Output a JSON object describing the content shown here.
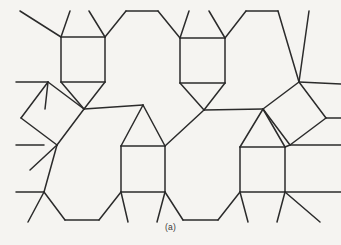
{
  "figure": {
    "caption": "(a)",
    "background_color": "#f5f4f1",
    "stroke_color": "#2b2b2b",
    "stroke_width": 1.5,
    "width": 341,
    "height": 245
  },
  "chart_data": {
    "type": "diagram",
    "subtype": "geometric-tiling",
    "caption": "(a)",
    "xlabel": "",
    "ylabel": "",
    "xlim": [
      0,
      341
    ],
    "ylim": [
      0,
      245
    ],
    "grid": false,
    "legend": null,
    "tile_counts": {
      "squares_axis_aligned": 4,
      "squares_tilted": 2,
      "triangles": 4,
      "hexagons_full_or_partial": 6
    },
    "polygons": [
      {
        "name": "square-top-left",
        "shape": "square",
        "points": "61,37 105,37 105,82 61,82"
      },
      {
        "name": "square-top-right",
        "shape": "square",
        "points": "180,38 225,38 225,83 180,83"
      },
      {
        "name": "square-bottom-left",
        "shape": "square",
        "points": "121,146 165,146 165,192 121,192"
      },
      {
        "name": "square-bottom-right",
        "shape": "square",
        "points": "240,147 285,147 285,192 240,192"
      },
      {
        "name": "square-tilted-left",
        "shape": "square",
        "points": "48,82 21,118 57,145 84,109"
      },
      {
        "name": "square-tilted-right",
        "shape": "square",
        "points": "263,109 290,145 326,118 299,82"
      },
      {
        "name": "triangle-up-left",
        "shape": "triangle",
        "points": "143,105 121,146 165,146"
      },
      {
        "name": "triangle-up-right",
        "shape": "triangle",
        "points": "263,109 240,147 285,147"
      },
      {
        "name": "triangle-down-left",
        "shape": "triangle",
        "points": "61,82 105,82 84,109"
      },
      {
        "name": "triangle-down-right",
        "shape": "triangle",
        "points": "180,83 225,83 204,110"
      },
      {
        "name": "hexagon-top-middle",
        "shape": "hexagon",
        "points": "105,37 126,11 158,11 180,38 162,66 126,66"
      },
      {
        "name": "hexagon-center-left",
        "shape": "hexagon",
        "points": "84,109 143,105 121,146 57,145 41,120 48,82"
      },
      {
        "name": "hexagon-center-right",
        "shape": "hexagon",
        "points": "204,110 263,109 240,147 180,146 162,120 180,83"
      },
      {
        "name": "hexagon-bottom-left",
        "shape": "hexagon",
        "points": "57,145 121,146 121,192 99,220 65,220 44,192"
      },
      {
        "name": "hexagon-bottom-right",
        "shape": "hexagon",
        "points": "180,192 240,192 240,192 218,220 183,220 165,192"
      }
    ],
    "edges": [
      {
        "name": "sq-tl-top",
        "x1": 61,
        "y1": 37,
        "x2": 105,
        "y2": 37
      },
      {
        "name": "sq-tl-right",
        "x1": 105,
        "y1": 37,
        "x2": 105,
        "y2": 82
      },
      {
        "name": "sq-tl-bottom",
        "x1": 105,
        "y1": 82,
        "x2": 61,
        "y2": 82
      },
      {
        "name": "sq-tl-left",
        "x1": 61,
        "y1": 82,
        "x2": 61,
        "y2": 37
      },
      {
        "name": "sq-tr-top",
        "x1": 180,
        "y1": 38,
        "x2": 225,
        "y2": 38
      },
      {
        "name": "sq-tr-right",
        "x1": 225,
        "y1": 38,
        "x2": 225,
        "y2": 83
      },
      {
        "name": "sq-tr-bottom",
        "x1": 225,
        "y1": 83,
        "x2": 180,
        "y2": 83
      },
      {
        "name": "sq-tr-left",
        "x1": 180,
        "y1": 83,
        "x2": 180,
        "y2": 38
      },
      {
        "name": "sq-bl-top",
        "x1": 121,
        "y1": 146,
        "x2": 165,
        "y2": 146
      },
      {
        "name": "sq-bl-right",
        "x1": 165,
        "y1": 146,
        "x2": 165,
        "y2": 192
      },
      {
        "name": "sq-bl-bottom",
        "x1": 165,
        "y1": 192,
        "x2": 121,
        "y2": 192
      },
      {
        "name": "sq-bl-left",
        "x1": 121,
        "y1": 192,
        "x2": 121,
        "y2": 146
      },
      {
        "name": "sq-br-top",
        "x1": 240,
        "y1": 147,
        "x2": 285,
        "y2": 147
      },
      {
        "name": "sq-br-right",
        "x1": 285,
        "y1": 147,
        "x2": 285,
        "y2": 192
      },
      {
        "name": "sq-br-bottom",
        "x1": 285,
        "y1": 192,
        "x2": 240,
        "y2": 192
      },
      {
        "name": "sq-br-left",
        "x1": 240,
        "y1": 192,
        "x2": 240,
        "y2": 147
      },
      {
        "name": "tilt-l-a",
        "x1": 48,
        "y1": 82,
        "x2": 21,
        "y2": 118
      },
      {
        "name": "tilt-l-b",
        "x1": 21,
        "y1": 118,
        "x2": 57,
        "y2": 145
      },
      {
        "name": "tilt-l-c",
        "x1": 57,
        "y1": 145,
        "x2": 84,
        "y2": 109
      },
      {
        "name": "tilt-l-d",
        "x1": 84,
        "y1": 109,
        "x2": 48,
        "y2": 82
      },
      {
        "name": "tilt-r-a",
        "x1": 299,
        "y1": 82,
        "x2": 326,
        "y2": 118
      },
      {
        "name": "tilt-r-b",
        "x1": 326,
        "y1": 118,
        "x2": 290,
        "y2": 145
      },
      {
        "name": "tilt-r-c",
        "x1": 290,
        "y1": 145,
        "x2": 263,
        "y2": 109
      },
      {
        "name": "tilt-r-d",
        "x1": 263,
        "y1": 109,
        "x2": 299,
        "y2": 82
      },
      {
        "name": "tri-dl-a",
        "x1": 61,
        "y1": 82,
        "x2": 84,
        "y2": 109
      },
      {
        "name": "tri-dl-b",
        "x1": 84,
        "y1": 109,
        "x2": 105,
        "y2": 82
      },
      {
        "name": "tri-dr-a",
        "x1": 180,
        "y1": 83,
        "x2": 204,
        "y2": 110
      },
      {
        "name": "tri-dr-b",
        "x1": 204,
        "y1": 110,
        "x2": 225,
        "y2": 83
      },
      {
        "name": "tri-ul-a",
        "x1": 143,
        "y1": 105,
        "x2": 121,
        "y2": 146
      },
      {
        "name": "tri-ul-b",
        "x1": 143,
        "y1": 105,
        "x2": 165,
        "y2": 146
      },
      {
        "name": "tri-ur-a",
        "x1": 263,
        "y1": 109,
        "x2": 240,
        "y2": 147
      },
      {
        "name": "tri-ur-b",
        "x1": 263,
        "y1": 109,
        "x2": 285,
        "y2": 147
      },
      {
        "name": "hex-top-a",
        "x1": 105,
        "y1": 37,
        "x2": 126,
        "y2": 11
      },
      {
        "name": "hex-top-b",
        "x1": 126,
        "y1": 11,
        "x2": 158,
        "y2": 11
      },
      {
        "name": "hex-top-c",
        "x1": 158,
        "y1": 11,
        "x2": 180,
        "y2": 38
      },
      {
        "name": "hex-top-d",
        "x1": 225,
        "y1": 38,
        "x2": 246,
        "y2": 11
      },
      {
        "name": "hex-top-e",
        "x1": 246,
        "y1": 11,
        "x2": 278,
        "y2": 11
      },
      {
        "name": "hex-top-f",
        "x1": 278,
        "y1": 11,
        "x2": 299,
        "y2": 82
      },
      {
        "name": "hex-cl-a",
        "x1": 84,
        "y1": 109,
        "x2": 143,
        "y2": 105
      },
      {
        "name": "hex-cr-a",
        "x1": 204,
        "y1": 110,
        "x2": 263,
        "y2": 109
      },
      {
        "name": "hex-cr-b",
        "x1": 165,
        "y1": 146,
        "x2": 204,
        "y2": 110
      },
      {
        "name": "hex-cl-b",
        "x1": 45,
        "y1": 109,
        "x2": 48,
        "y2": 82
      },
      {
        "name": "hex-bl-a",
        "x1": 57,
        "y1": 145,
        "x2": 44,
        "y2": 192
      },
      {
        "name": "hex-bl-b",
        "x1": 44,
        "y1": 192,
        "x2": 65,
        "y2": 220
      },
      {
        "name": "hex-bl-c",
        "x1": 65,
        "y1": 220,
        "x2": 99,
        "y2": 220
      },
      {
        "name": "hex-bl-d",
        "x1": 99,
        "y1": 220,
        "x2": 121,
        "y2": 192
      },
      {
        "name": "hex-bm-a",
        "x1": 165,
        "y1": 192,
        "x2": 183,
        "y2": 220
      },
      {
        "name": "hex-bm-b",
        "x1": 183,
        "y1": 220,
        "x2": 218,
        "y2": 220
      },
      {
        "name": "hex-bm-c",
        "x1": 218,
        "y1": 220,
        "x2": 240,
        "y2": 192
      },
      {
        "name": "hex-cr-c",
        "x1": 290,
        "y1": 145,
        "x2": 285,
        "y2": 147
      },
      {
        "name": "stub-top-1",
        "x1": 61,
        "y1": 37,
        "x2": 20,
        "y2": 11
      },
      {
        "name": "stub-top-2",
        "x1": 61,
        "y1": 37,
        "x2": 70,
        "y2": 11
      },
      {
        "name": "stub-top-3",
        "x1": 105,
        "y1": 37,
        "x2": 89,
        "y2": 11
      },
      {
        "name": "stub-top-4",
        "x1": 180,
        "y1": 38,
        "x2": 189,
        "y2": 11
      },
      {
        "name": "stub-top-5",
        "x1": 225,
        "y1": 38,
        "x2": 209,
        "y2": 11
      },
      {
        "name": "stub-top-6",
        "x1": 299,
        "y1": 82,
        "x2": 309,
        "y2": 11
      },
      {
        "name": "stub-top-7",
        "x1": 299,
        "y1": 82,
        "x2": 341,
        "y2": 84
      },
      {
        "name": "stub-left-1",
        "x1": 48,
        "y1": 82,
        "x2": 16,
        "y2": 82
      },
      {
        "name": "stub-left-2",
        "x1": 44,
        "y1": 145,
        "x2": 16,
        "y2": 145
      },
      {
        "name": "stub-left-3",
        "x1": 57,
        "y1": 145,
        "x2": 30,
        "y2": 170
      },
      {
        "name": "stub-left-4",
        "x1": 44,
        "y1": 192,
        "x2": 16,
        "y2": 192
      },
      {
        "name": "stub-left-5",
        "x1": 44,
        "y1": 192,
        "x2": 28,
        "y2": 222
      },
      {
        "name": "stub-right-1",
        "x1": 326,
        "y1": 118,
        "x2": 341,
        "y2": 118
      },
      {
        "name": "stub-right-2",
        "x1": 290,
        "y1": 145,
        "x2": 341,
        "y2": 145
      },
      {
        "name": "stub-right-3",
        "x1": 285,
        "y1": 192,
        "x2": 320,
        "y2": 222
      },
      {
        "name": "stub-right-4",
        "x1": 285,
        "y1": 192,
        "x2": 341,
        "y2": 192
      },
      {
        "name": "stub-bot-1",
        "x1": 121,
        "y1": 192,
        "x2": 128,
        "y2": 222
      },
      {
        "name": "stub-bot-2",
        "x1": 165,
        "y1": 192,
        "x2": 157,
        "y2": 222
      },
      {
        "name": "stub-bot-3",
        "x1": 240,
        "y1": 192,
        "x2": 248,
        "y2": 222
      },
      {
        "name": "stub-bot-4",
        "x1": 285,
        "y1": 192,
        "x2": 277,
        "y2": 222
      }
    ]
  }
}
